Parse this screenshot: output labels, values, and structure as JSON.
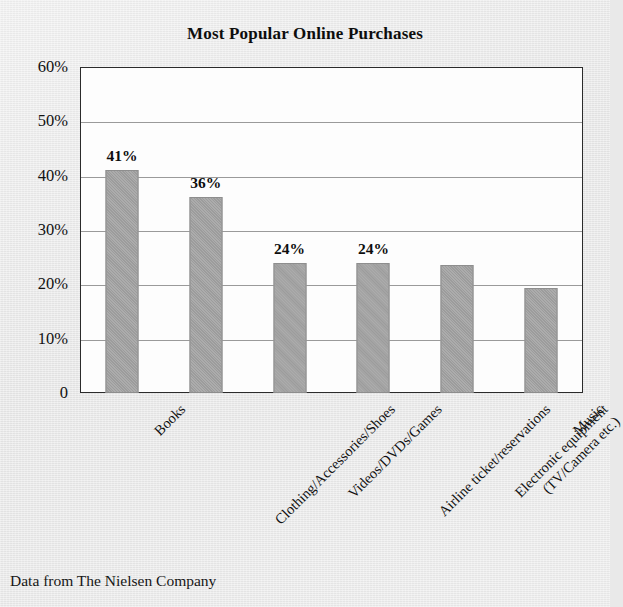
{
  "title": "Most Popular Online Purchases",
  "source_note": "Data from The Nielsen Company",
  "axis": {
    "y_ticks": [
      "60%",
      "50%",
      "40%",
      "30%",
      "20%",
      "10%",
      "0"
    ]
  },
  "colors": {
    "bar_fill": "#a3a3a3",
    "bar_border": "#8e8e8e",
    "plot_background": "#fdfdfd",
    "page_background": "#e9e9e9",
    "axis_line": "#2b2b2b",
    "gridline": "#9a9a9a",
    "text": "#111111"
  },
  "chart_data": {
    "type": "bar",
    "title": "Most Popular Online Purchases",
    "xlabel": "",
    "ylabel": "",
    "ylim": [
      0,
      60
    ],
    "y_tick_values": [
      0,
      10,
      20,
      30,
      40,
      50,
      60
    ],
    "y_tick_labels": [
      "0",
      "10%",
      "20%",
      "30%",
      "40%",
      "50%",
      "60%"
    ],
    "grid": true,
    "legend": false,
    "categories": [
      "Books",
      "Clothing/Accessories/Shoes",
      "Videos/DVDs/Games",
      "Airline ticket/reservations",
      "Electronic equipment (TV/Camera etc.)",
      "Music"
    ],
    "values": [
      41,
      36,
      24,
      24,
      23.5,
      19.3
    ],
    "data_labels": [
      "41%",
      "36%",
      "24%",
      "24%",
      "",
      ""
    ],
    "source": "Data from The Nielsen Company"
  },
  "bars": [
    {
      "category": "Books",
      "category_line1": "Books",
      "category_line2": "",
      "value": 41,
      "label": "41%"
    },
    {
      "category": "Clothing/Accessories/Shoes",
      "category_line1": "Clothing/Accessories/Shoes",
      "category_line2": "",
      "value": 36,
      "label": "36%"
    },
    {
      "category": "Videos/DVDs/Games",
      "category_line1": "Videos/DVDs/Games",
      "category_line2": "",
      "value": 24,
      "label": "24%"
    },
    {
      "category": "Airline ticket/reservations",
      "category_line1": "Airline ticket/reservations",
      "category_line2": "",
      "value": 24,
      "label": "24%"
    },
    {
      "category": "Electronic equipment (TV/Camera etc.)",
      "category_line1": "Electronic equipment",
      "category_line2": "(TV/Camera etc.)",
      "value": 23.5,
      "label": ""
    },
    {
      "category": "Music",
      "category_line1": "Music",
      "category_line2": "",
      "value": 19.3,
      "label": ""
    }
  ]
}
